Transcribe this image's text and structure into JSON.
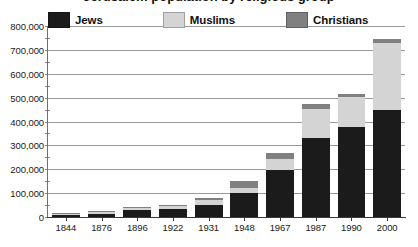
{
  "title": "Jerusalem population by religious group",
  "legend": {
    "position": "top",
    "items": [
      {
        "label": "Jews",
        "key": "jews",
        "color": "#1b1b1b"
      },
      {
        "label": "Muslims",
        "key": "muslims",
        "color": "#d4d4d4"
      },
      {
        "label": "Christians",
        "key": "christians",
        "color": "#808080"
      }
    ]
  },
  "chart_data": {
    "type": "bar",
    "stacked": true,
    "title": "Jerusalem population by religious group",
    "xlabel": "",
    "ylabel": "",
    "ylim": [
      0,
      800000
    ],
    "ytick_step": 100000,
    "grid": true,
    "legend_position": "top",
    "categories": [
      "1844",
      "1876",
      "1896",
      "1922",
      "1931",
      "1948",
      "1967",
      "1987",
      "1990",
      "2000"
    ],
    "ytick_labels": [
      "0",
      "100,000",
      "200,000",
      "300,000",
      "400,000",
      "500,000",
      "600,000",
      "700,000",
      "800,000"
    ],
    "ytick_values": [
      0,
      100000,
      200000,
      300000,
      400000,
      500000,
      600000,
      700000,
      800000
    ],
    "series": [
      {
        "name": "Jews",
        "color": "#1b1b1b",
        "values": [
          7000,
          12000,
          28000,
          34000,
          51000,
          100000,
          196000,
          329000,
          378000,
          448000
        ]
      },
      {
        "name": "Muslims",
        "color": "#d4d4d4",
        "values": [
          5000,
          7000,
          8000,
          13000,
          19000,
          22000,
          46000,
          125000,
          123000,
          280000
        ]
      },
      {
        "name": "Christians",
        "color": "#808080",
        "values": [
          3000,
          5000,
          8000,
          5000,
          10000,
          30000,
          25000,
          20000,
          16000,
          18000
        ]
      }
    ],
    "totals": [
      15000,
      24000,
      44000,
      52000,
      80000,
      152000,
      267000,
      474000,
      517000,
      746000
    ]
  }
}
